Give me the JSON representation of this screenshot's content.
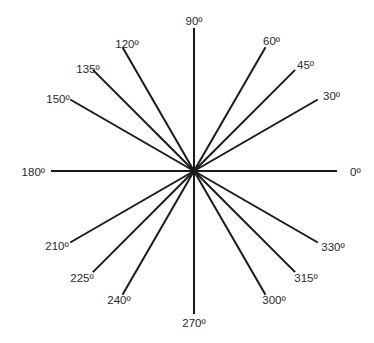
{
  "diagram": {
    "center": [
      194,
      171
    ],
    "ray_length": 143,
    "line_color": "#1a1a1a",
    "label_color": "#2a2a2a",
    "rays": [
      {
        "angle": 0,
        "label": "0º",
        "label_pos": [
          350,
          176
        ],
        "anchor": "start"
      },
      {
        "angle": 30,
        "label": "30º",
        "label_pos": [
          323,
          100
        ],
        "anchor": "start"
      },
      {
        "angle": 45,
        "label": "45º",
        "label_pos": [
          297,
          69
        ],
        "anchor": "start"
      },
      {
        "angle": 60,
        "label": "60º",
        "label_pos": [
          263,
          45
        ],
        "anchor": "start"
      },
      {
        "angle": 90,
        "label": "90º",
        "label_pos": [
          194,
          25
        ],
        "anchor": "middle"
      },
      {
        "angle": 120,
        "label": "120º",
        "label_pos": [
          127,
          48
        ],
        "anchor": "middle"
      },
      {
        "angle": 135,
        "label": "135º",
        "label_pos": [
          88,
          73
        ],
        "anchor": "middle"
      },
      {
        "angle": 150,
        "label": "150º",
        "label_pos": [
          58,
          103
        ],
        "anchor": "middle"
      },
      {
        "angle": 180,
        "label": "180º",
        "label_pos": [
          45,
          176
        ],
        "anchor": "end"
      },
      {
        "angle": 210,
        "label": "210º",
        "label_pos": [
          57,
          250
        ],
        "anchor": "middle"
      },
      {
        "angle": 225,
        "label": "225º",
        "label_pos": [
          82,
          282
        ],
        "anchor": "middle"
      },
      {
        "angle": 240,
        "label": "240º",
        "label_pos": [
          119,
          304
        ],
        "anchor": "middle"
      },
      {
        "angle": 270,
        "label": "270º",
        "label_pos": [
          194,
          327
        ],
        "anchor": "middle"
      },
      {
        "angle": 300,
        "label": "300º",
        "label_pos": [
          274,
          304
        ],
        "anchor": "middle"
      },
      {
        "angle": 315,
        "label": "315º",
        "label_pos": [
          306,
          282
        ],
        "anchor": "middle"
      },
      {
        "angle": 330,
        "label": "330º",
        "label_pos": [
          333,
          251
        ],
        "anchor": "middle"
      }
    ]
  }
}
